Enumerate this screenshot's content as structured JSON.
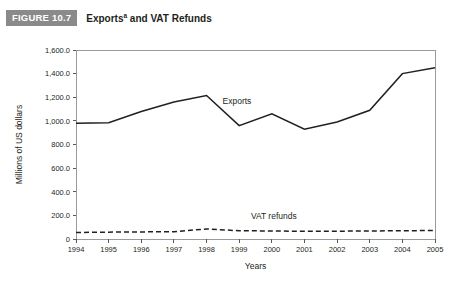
{
  "figure": {
    "badge": "FIGURE 10.7",
    "title_main": "Exports",
    "title_superscript": "a",
    "title_rest": " and VAT Refunds"
  },
  "chart_data": {
    "type": "line",
    "xlabel": "Years",
    "ylabel": "Millions of US dollars",
    "categories": [
      "1994",
      "1995",
      "1996",
      "1997",
      "1998",
      "1999",
      "2000",
      "2001",
      "2002",
      "2003",
      "2004",
      "2005"
    ],
    "x": [
      1994,
      1995,
      1996,
      1997,
      1998,
      1999,
      2000,
      2001,
      2002,
      2003,
      2004,
      2005
    ],
    "ylim": [
      0,
      1600
    ],
    "xlim": [
      1994,
      2005
    ],
    "ytick_labels": [
      "1,600.0",
      "1,400.0",
      "1,200.0",
      "1,000.0",
      "800.0",
      "600.0",
      "400.0",
      "200.0",
      "0"
    ],
    "ytick_values": [
      1600,
      1400,
      1200,
      1000,
      800,
      600,
      400,
      200,
      0
    ],
    "grid": false,
    "legend_position": "inline-annotation",
    "series": [
      {
        "name": "Exports",
        "style": "solid",
        "color": "#231f20",
        "label_text": "Exports",
        "values": [
          980,
          985,
          1080,
          1160,
          1215,
          960,
          1060,
          930,
          990,
          1090,
          1400,
          1450
        ]
      },
      {
        "name": "VAT refunds",
        "style": "dashed",
        "color": "#231f20",
        "label_text": "VAT refunds",
        "values": [
          55,
          58,
          60,
          62,
          85,
          70,
          68,
          65,
          66,
          68,
          70,
          72
        ]
      }
    ]
  }
}
